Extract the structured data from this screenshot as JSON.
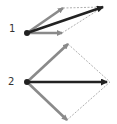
{
  "colors": {
    "component": "#8a8a8a",
    "resultant": "#222222",
    "guide": "#9a9a9a",
    "label": "#333333"
  },
  "diagrams": [
    {
      "label": "1",
      "label_pos": [
        9,
        24
      ],
      "origin": [
        27,
        33
      ],
      "components": [
        [
          63,
          8
        ],
        [
          62,
          33
        ]
      ],
      "resultant": [
        103,
        7
      ],
      "guides": [
        [
          [
            63,
            8
          ],
          [
            103,
            7
          ]
        ],
        [
          [
            62,
            33
          ],
          [
            103,
            7
          ]
        ]
      ]
    },
    {
      "label": "2",
      "label_pos": [
        8,
        77
      ],
      "origin": [
        27,
        82
      ],
      "components": [
        [
          68,
          44
        ],
        [
          67,
          120
        ]
      ],
      "resultant": [
        107,
        82
      ],
      "guides": [
        [
          [
            68,
            44
          ],
          [
            110,
            82
          ]
        ],
        [
          [
            67,
            120
          ],
          [
            110,
            82
          ]
        ]
      ]
    }
  ]
}
